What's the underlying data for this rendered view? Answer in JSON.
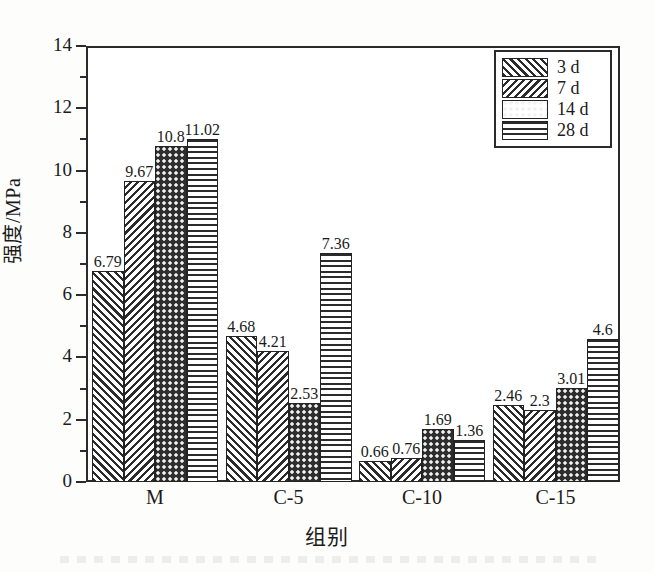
{
  "chart_data": {
    "type": "bar",
    "title": "",
    "subtitle": "",
    "xlabel": "组别",
    "ylabel": "强度/MPa",
    "categories": [
      "M",
      "C-5",
      "C-10",
      "C-15"
    ],
    "series": [
      {
        "name": "3 d",
        "pattern": "forward-diagonal-hatch",
        "values": [
          6.79,
          4.68,
          0.66,
          2.46
        ]
      },
      {
        "name": "7 d",
        "pattern": "backward-diagonal-hatch",
        "values": [
          9.67,
          4.21,
          0.76,
          2.3
        ]
      },
      {
        "name": "14 d",
        "pattern": "dark-dotted",
        "values": [
          10.8,
          2.53,
          1.69,
          3.01
        ]
      },
      {
        "name": "28 d",
        "pattern": "horizontal-lines",
        "values": [
          11.02,
          7.36,
          1.36,
          4.6
        ]
      }
    ],
    "value_labels": [
      [
        "6.79",
        "9.67",
        "10.8",
        "11.02"
      ],
      [
        "4.68",
        "4.21",
        "2.53",
        "7.36"
      ],
      [
        "0.66",
        "0.76",
        "1.69",
        "1.36"
      ],
      [
        "2.46",
        "2.3",
        "3.01",
        "4.6"
      ]
    ],
    "ylim": [
      0,
      14
    ],
    "ytick_major": [
      0,
      2,
      4,
      6,
      8,
      10,
      12,
      14
    ],
    "ytick_major_labels": [
      "0",
      "2",
      "4",
      "6",
      "8",
      "10",
      "12",
      "14"
    ],
    "ytick_minor": [
      1,
      3,
      5,
      7,
      9,
      11,
      13
    ],
    "grid": false,
    "legend_position": "top-right",
    "frame": "box",
    "colors": {
      "axis": "#2b2b2b",
      "text": "#1a1a1a",
      "bar_edge": "#232323",
      "hatch": "#2b2b2b",
      "background": "#ffffff"
    }
  },
  "legend": {
    "entries": [
      {
        "label": "3 d"
      },
      {
        "label": "7 d"
      },
      {
        "label": "14 d"
      },
      {
        "label": "28 d"
      }
    ]
  },
  "axes": {
    "y_title": "强度/MPa",
    "x_title": "组别"
  }
}
